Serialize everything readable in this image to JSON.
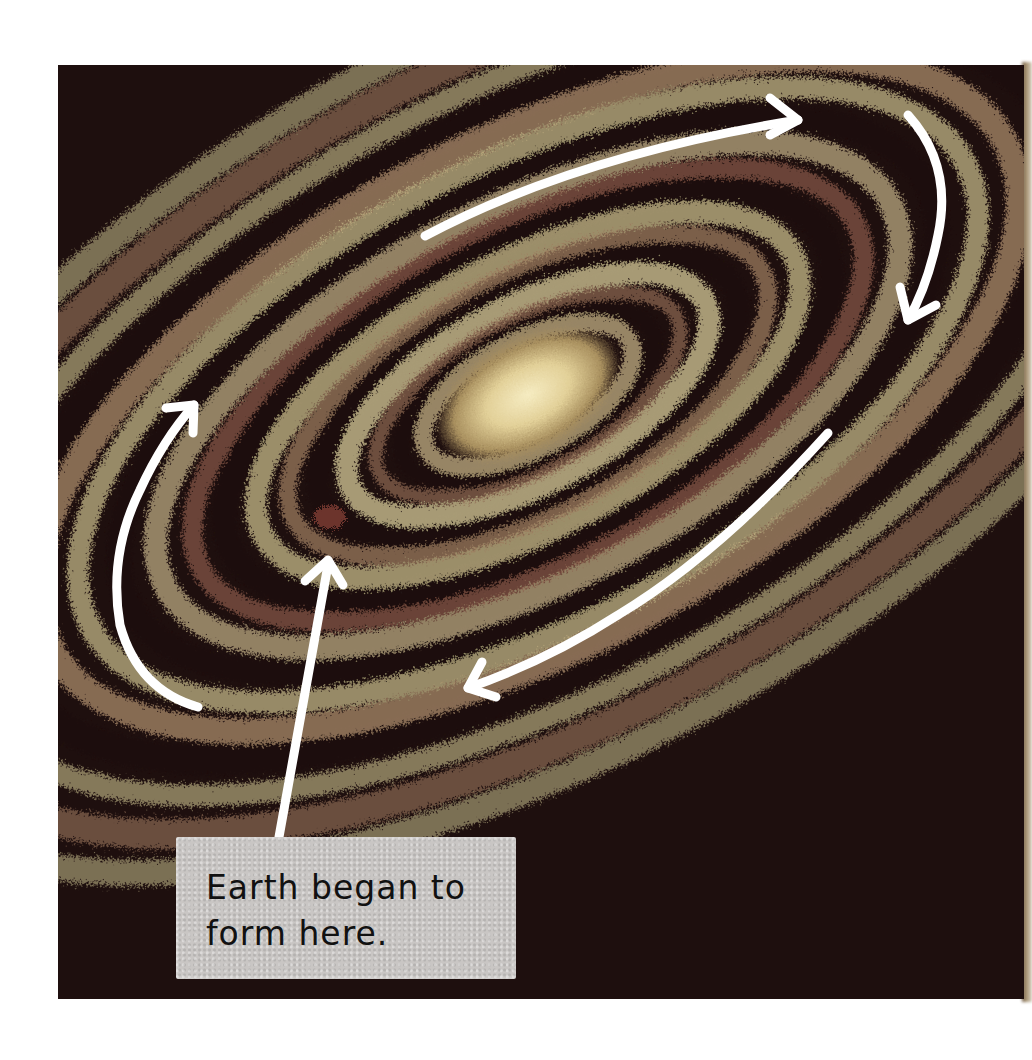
{
  "illustration": {
    "subject": "swirling disk of dust and gas around the young Sun",
    "style": "pastel chalk on black paper",
    "colors": {
      "background": "#1e0f0e",
      "band_cream": "#c9bf8e",
      "band_tan": "#a98a6a",
      "band_rust": "#8a5a48",
      "core_glow": "#f1e4b0",
      "arrow": "#ffffff",
      "caption_box": "#c9c6c4",
      "caption_text": "#111111"
    },
    "rotation_arrows": [
      {
        "position": "top",
        "direction": "left-to-right"
      },
      {
        "position": "right",
        "direction": "downward"
      },
      {
        "position": "lower-right",
        "direction": "right-to-left"
      },
      {
        "position": "left",
        "direction": "upward"
      }
    ],
    "pointer_arrow": {
      "target": "reddish spot on inner ring",
      "from": "caption"
    }
  },
  "caption": {
    "text": "Earth began to\nform here."
  }
}
